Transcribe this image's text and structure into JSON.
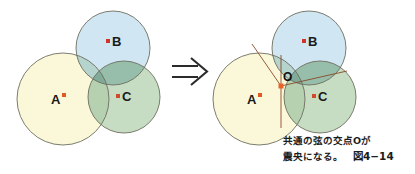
{
  "figure": {
    "number_label": "図4−14",
    "caption_line1": "共通の弦の交点Oが",
    "caption_line2": "震央になる。",
    "transition_arrow": "double-right-arrow"
  },
  "colors": {
    "circle_a_fill": "#fbf8d8",
    "circle_b_fill": "#c9e2f0",
    "circle_c_fill": "#b9d4b4",
    "circle_stroke": "#6e6e60",
    "station_dot": "#e05a22",
    "chord_line": "#8a4a28",
    "epicenter_dot": "#e8622a",
    "background": "#ffffff",
    "text": "#1a1a1a",
    "arrow": "#2b2b2b"
  },
  "left_diagram": {
    "name": "three-observation-circles",
    "circles": [
      {
        "id": "A",
        "label": "A",
        "cx": 63,
        "cy": 99,
        "r": 46,
        "fill_key": "circle_a_fill"
      },
      {
        "id": "B",
        "label": "B",
        "cx": 113,
        "cy": 48,
        "r": 37,
        "fill_key": "circle_b_fill"
      },
      {
        "id": "C",
        "label": "C",
        "cx": 124,
        "cy": 97,
        "r": 36,
        "fill_key": "circle_c_fill"
      }
    ],
    "station_labels": [
      {
        "id": "A",
        "text": "A",
        "x": 51,
        "y": 104,
        "dot_x": 64,
        "dot_y": 95
      },
      {
        "id": "B",
        "text": "B",
        "x": 114,
        "y": 46,
        "dot_x": 108,
        "dot_y": 41
      },
      {
        "id": "C",
        "text": "C",
        "x": 125,
        "y": 101,
        "dot_x": 118,
        "dot_y": 96
      }
    ]
  },
  "right_diagram": {
    "name": "three-circles-with-common-chords",
    "circles": [
      {
        "id": "A",
        "label": "A",
        "cx": 259,
        "cy": 99,
        "r": 46,
        "fill_key": "circle_a_fill"
      },
      {
        "id": "B",
        "label": "B",
        "cx": 309,
        "cy": 48,
        "r": 37,
        "fill_key": "circle_b_fill"
      },
      {
        "id": "C",
        "label": "C",
        "cx": 320,
        "cy": 97,
        "r": 36,
        "fill_key": "circle_c_fill"
      }
    ],
    "station_labels": [
      {
        "id": "A",
        "text": "A",
        "x": 247,
        "y": 104,
        "dot_x": 260,
        "dot_y": 95
      },
      {
        "id": "B",
        "text": "B",
        "x": 310,
        "y": 46,
        "dot_x": 304,
        "dot_y": 41
      },
      {
        "id": "C",
        "text": "C",
        "x": 321,
        "y": 101,
        "dot_x": 314,
        "dot_y": 96
      }
    ],
    "epicenter": {
      "id": "O",
      "label": "O",
      "x": 281,
      "y": 86,
      "label_x": 284,
      "label_y": 80
    },
    "chords": [
      {
        "id": "chord-ab",
        "x1": 252,
        "y1": 44,
        "x2": 281,
        "y2": 86
      },
      {
        "id": "chord-bc",
        "x1": 281,
        "y1": 86,
        "x2": 347,
        "y2": 71
      },
      {
        "id": "chord-ac",
        "x1": 281,
        "y1": 55,
        "x2": 281,
        "y2": 128
      }
    ]
  },
  "arrow": {
    "name": "implies-arrow",
    "x": 172,
    "y": 72,
    "width": 34
  }
}
